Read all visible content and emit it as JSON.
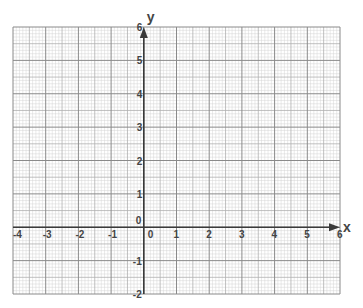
{
  "graph_paper": {
    "x_axis": {
      "name": "x",
      "min": -4,
      "max": 6,
      "step": 1,
      "tick_labels": [
        "-4",
        "-3",
        "-2",
        "-1",
        "0",
        "1",
        "2",
        "3",
        "4",
        "5",
        "6"
      ]
    },
    "y_axis": {
      "name": "y",
      "min": -2,
      "max": 6,
      "step": 1,
      "tick_labels": [
        "-2",
        "-1",
        "0",
        "1",
        "2",
        "3",
        "4",
        "5",
        "6"
      ]
    },
    "origin_label": "0",
    "minor_divisions_per_unit": 10,
    "mid_divisions_per_unit": 2,
    "colors": {
      "minor_grid": "#d4d4d4",
      "mid_grid": "#b0b0b0",
      "major_grid": "#8a8a8a",
      "axis": "#3a3a3a",
      "label": "#444444"
    }
  }
}
